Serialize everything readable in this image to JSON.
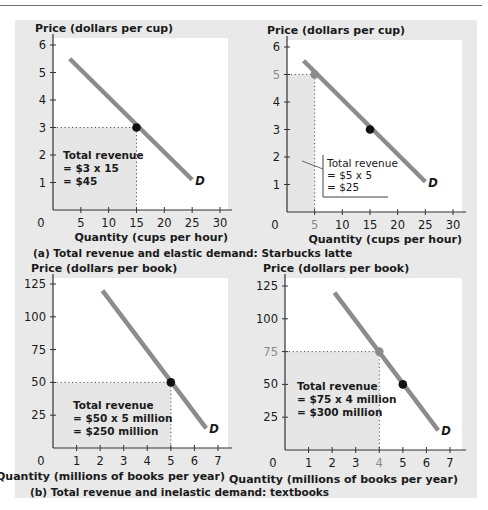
{
  "chart_data": [
    {
      "type": "line",
      "id": "latte-at-3",
      "ylabel": "Price (dollars per cup)",
      "xlabel": "Quantity (cups per hour)",
      "caption": "(a) Total revenue and elastic demand: Starbucks latte",
      "xlim": [
        0,
        30
      ],
      "ylim": [
        0,
        6
      ],
      "xticks": [
        0,
        5,
        10,
        15,
        20,
        25,
        30
      ],
      "yticks": [
        1,
        2,
        3,
        4,
        5,
        6
      ],
      "demand": {
        "label": "D",
        "points": [
          [
            3,
            5.5
          ],
          [
            25,
            1.1
          ]
        ]
      },
      "highlight": {
        "x": 15,
        "y": 3,
        "color": "#111111"
      },
      "other_points": [],
      "revenue_box": {
        "lines": [
          "Total revenue",
          "= $3 x 15",
          "= $45"
        ],
        "style": "bold"
      }
    },
    {
      "type": "line",
      "id": "latte-at-5",
      "ylabel": "Price (dollars per cup)",
      "xlabel": "Quantity (cups per hour)",
      "caption": "",
      "xlim": [
        0,
        30
      ],
      "ylim": [
        0,
        6
      ],
      "xticks": [
        0,
        5,
        10,
        15,
        20,
        25,
        30
      ],
      "yticks": [
        1,
        2,
        3,
        4,
        5,
        6
      ],
      "demand": {
        "label": "D",
        "points": [
          [
            3,
            5.5
          ],
          [
            25,
            1.1
          ]
        ]
      },
      "highlight": {
        "x": 5,
        "y": 5,
        "color": "#8a8a8a"
      },
      "other_points": [
        {
          "x": 15,
          "y": 3,
          "color": "#111111"
        }
      ],
      "revenue_box": {
        "lines": [
          "Total revenue",
          "= $5 x 5",
          "= $25"
        ],
        "style": "boxed"
      }
    },
    {
      "type": "line",
      "id": "textbooks-at-50",
      "ylabel": "Price (dollars per book)",
      "xlabel": "Quantity (millions of books per year)",
      "caption": "(b)  Total revenue and inelastic demand: textbooks",
      "xlim": [
        0,
        7
      ],
      "ylim": [
        0,
        125
      ],
      "xticks": [
        0,
        1,
        2,
        3,
        4,
        5,
        6,
        7
      ],
      "yticks": [
        25,
        50,
        75,
        100,
        125
      ],
      "demand": {
        "label": "D",
        "points": [
          [
            2.1,
            120
          ],
          [
            6.5,
            15
          ]
        ]
      },
      "highlight": {
        "x": 5,
        "y": 50,
        "color": "#111111"
      },
      "other_points": [],
      "revenue_box": {
        "lines": [
          "Total revenue",
          "= $50 x 5 million",
          "= $250 million"
        ],
        "style": "bold"
      }
    },
    {
      "type": "line",
      "id": "textbooks-at-75",
      "ylabel": "Price (dollars per book)",
      "xlabel": "Quantity (millions of books per year)",
      "caption": "",
      "xlim": [
        0,
        7
      ],
      "ylim": [
        0,
        125
      ],
      "xticks": [
        0,
        1,
        2,
        3,
        4,
        5,
        6,
        7
      ],
      "yticks": [
        25,
        50,
        75,
        100,
        125
      ],
      "demand": {
        "label": "D",
        "points": [
          [
            2.1,
            120
          ],
          [
            6.5,
            15
          ]
        ]
      },
      "highlight": {
        "x": 4,
        "y": 75,
        "color": "#8a8a8a"
      },
      "other_points": [
        {
          "x": 5,
          "y": 50,
          "color": "#111111"
        }
      ],
      "revenue_box": {
        "lines": [
          "Total revenue",
          "= $75 x 4 million",
          "= $300 million"
        ],
        "style": "bold"
      }
    }
  ],
  "colors": {
    "panel": "#e9e9e9",
    "plot": "#ffffff",
    "revenue_area": "#e6e6e6",
    "demand_line": "#8c8c8c",
    "axis": "#333333"
  }
}
